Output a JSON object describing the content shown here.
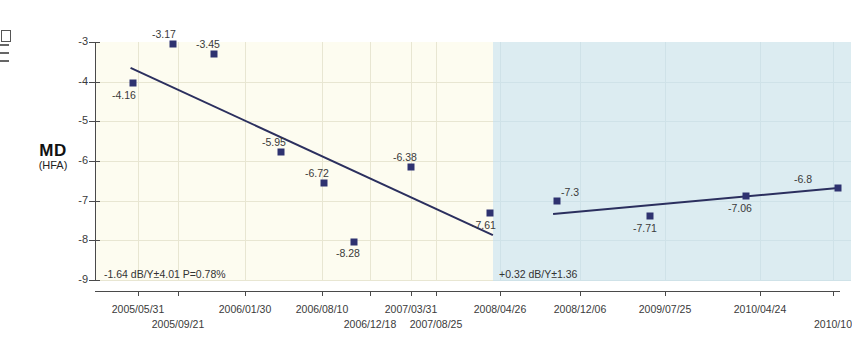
{
  "axis_title": {
    "main": "MD",
    "sub": "(HFA)"
  },
  "y_axis": {
    "ticks": [
      "-3",
      "-4",
      "-5",
      "-6",
      "-7",
      "-8",
      "-9"
    ],
    "min": -9,
    "max": -3
  },
  "x_axis": {
    "labels_top": [
      "2005/05/31",
      "2006/01/30",
      "2006/08/10",
      "2007/03/31",
      "2008/04/26",
      "2008/12/06",
      "2009/07/25",
      "2010/04/24"
    ],
    "labels_bottom": [
      "2005/09/21",
      "2006/12/18",
      "2007/08/25",
      "2010/10"
    ]
  },
  "annotations": {
    "early_fit": "-1.64 dB/Y±4.01  P=0.78%",
    "late_fit": "+0.32 dB/Y±1.36"
  },
  "colors": {
    "early_band": "#fdfcf0",
    "late_band": "#dcecf1",
    "marker": "#2e3270",
    "trend_line": "#2b2f5e",
    "axis": "#4a4a4a"
  },
  "chart_data": {
    "type": "scatter",
    "title": "",
    "xlabel": "",
    "ylabel": "MD (HFA)",
    "ylim": [
      -9,
      -3
    ],
    "grid": true,
    "legend": "none",
    "series": [
      {
        "name": "MD (HFA)",
        "points": [
          {
            "date": "2005/05/31",
            "value": -4.16,
            "label": "-4.16"
          },
          {
            "date": "2005/09/21",
            "value": -3.17,
            "label": "-3.17"
          },
          {
            "date": "2006/01/30",
            "value": -3.45,
            "label": "-3.45"
          },
          {
            "date": "2006/08/10",
            "value": -5.95,
            "label": "-5.95"
          },
          {
            "date": "2006/12/18",
            "value": -6.72,
            "label": "-6.72"
          },
          {
            "date": "2007/03/31",
            "value": -8.28,
            "label": "-8.28"
          },
          {
            "date": "2007/08/25",
            "value": -6.38,
            "label": "-6.38"
          },
          {
            "date": "2008/04/26",
            "value": -7.61,
            "label": "-7.61"
          },
          {
            "date": "2008/12/06",
            "value": -7.3,
            "label": "-7.3"
          },
          {
            "date": "2009/07/25",
            "value": -7.71,
            "label": "-7.71"
          },
          {
            "date": "2010/04/24",
            "value": -7.06,
            "label": "-7.06"
          },
          {
            "date": "2010/10",
            "value": -6.86,
            "label": "-6.8"
          }
        ]
      }
    ],
    "trends": [
      {
        "name": "early-period-regression",
        "slope_text": "-1.64 dB/Y±4.01  P=0.78%",
        "slope": -1.64,
        "se": 4.01,
        "p_text": "P=0.78%"
      },
      {
        "name": "late-period-regression",
        "slope_text": "+0.32 dB/Y±1.36",
        "slope": 0.32,
        "se": 1.36
      }
    ]
  },
  "_layout": {
    "dots": [
      {
        "x": 133,
        "y": 83,
        "lx": 112,
        "ly": 89
      },
      {
        "x": 173,
        "y": 44,
        "lx": 152,
        "ly": 28
      },
      {
        "x": 214,
        "y": 54,
        "lx": 196,
        "ly": 38
      },
      {
        "x": 281,
        "y": 152,
        "lx": 262,
        "ly": 136
      },
      {
        "x": 324,
        "y": 183,
        "lx": 305,
        "ly": 167
      },
      {
        "x": 354,
        "y": 242,
        "lx": 336,
        "ly": 247
      },
      {
        "x": 411,
        "y": 167,
        "lx": 393,
        "ly": 151
      },
      {
        "x": 490,
        "y": 213,
        "lx": 472,
        "ly": 219
      },
      {
        "x": 557,
        "y": 201,
        "lx": 561,
        "ly": 186
      },
      {
        "x": 650,
        "y": 216,
        "lx": 633,
        "ly": 222
      },
      {
        "x": 746,
        "y": 196,
        "lx": 728,
        "ly": 202
      },
      {
        "x": 838,
        "y": 188,
        "lx": 794,
        "ly": 173
      }
    ],
    "xticks_top": [
      138,
      245,
      322,
      411,
      500,
      580,
      665,
      760
    ],
    "xticks_bottom": [
      178,
      370,
      436,
      833
    ]
  }
}
